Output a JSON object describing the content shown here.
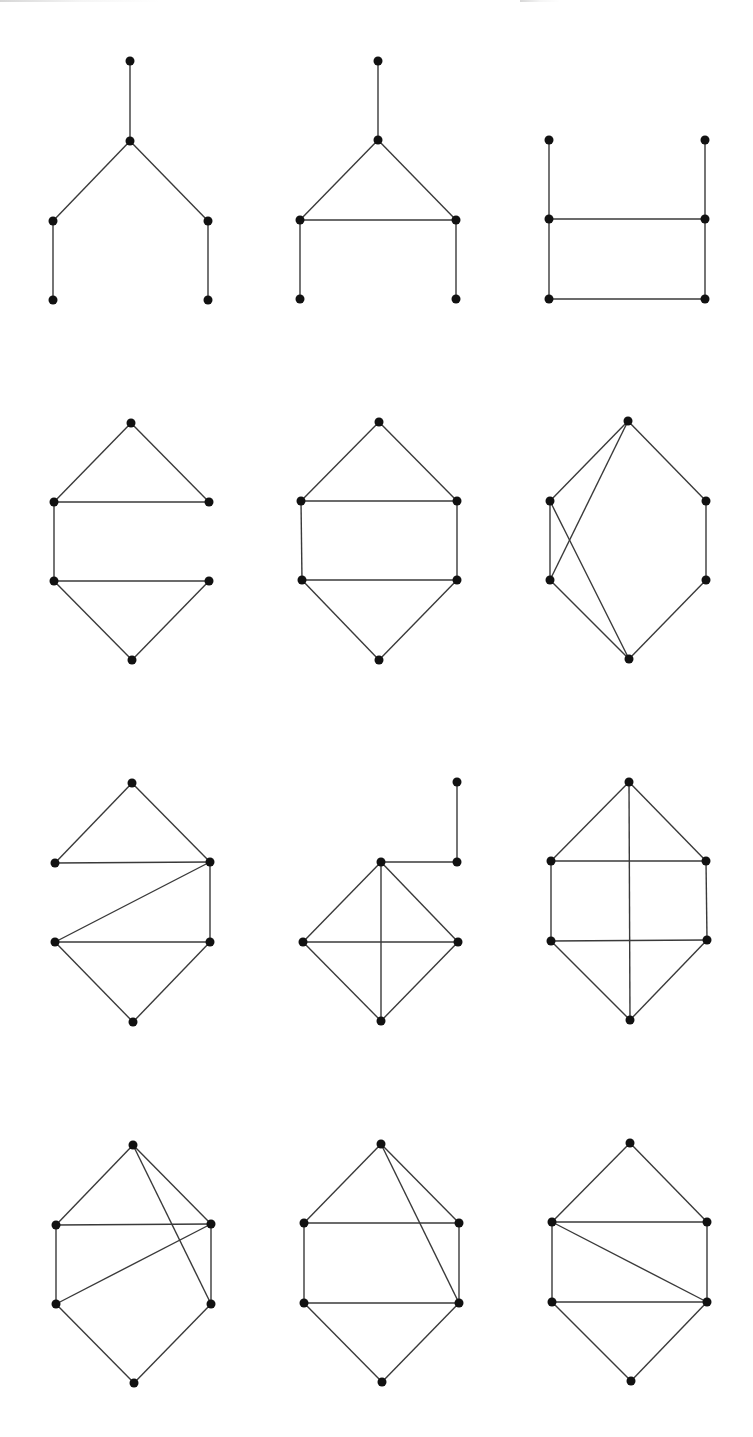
{
  "figure": {
    "width": 753,
    "height": 1437,
    "background": "#ffffff",
    "edge_color": "#3a3a3a",
    "node_color": "#111111",
    "node_radius": 4.5,
    "layout": "3 columns x 4 rows grid of graph drawings"
  },
  "graphs": [
    {
      "id": "graph-1",
      "nodes": [
        [
          130,
          61
        ],
        [
          130,
          141
        ],
        [
          53,
          221
        ],
        [
          208,
          221
        ],
        [
          53,
          300
        ],
        [
          208,
          300
        ]
      ],
      "edges": [
        [
          0,
          1
        ],
        [
          1,
          2
        ],
        [
          1,
          3
        ],
        [
          2,
          4
        ],
        [
          3,
          5
        ]
      ]
    },
    {
      "id": "graph-2",
      "nodes": [
        [
          378,
          61
        ],
        [
          378,
          140
        ],
        [
          300,
          220
        ],
        [
          456,
          220
        ],
        [
          300,
          299
        ],
        [
          456,
          299
        ]
      ],
      "edges": [
        [
          0,
          1
        ],
        [
          1,
          2
        ],
        [
          1,
          3
        ],
        [
          2,
          3
        ],
        [
          2,
          4
        ],
        [
          3,
          5
        ]
      ]
    },
    {
      "id": "graph-3",
      "nodes": [
        [
          549,
          140
        ],
        [
          705,
          140
        ],
        [
          549,
          219
        ],
        [
          705,
          219
        ],
        [
          549,
          299
        ],
        [
          705,
          299
        ]
      ],
      "edges": [
        [
          0,
          2
        ],
        [
          1,
          3
        ],
        [
          2,
          3
        ],
        [
          2,
          4
        ],
        [
          3,
          5
        ],
        [
          4,
          5
        ]
      ]
    },
    {
      "id": "graph-4",
      "nodes": [
        [
          131,
          423
        ],
        [
          54,
          502
        ],
        [
          209,
          502
        ],
        [
          54,
          581
        ],
        [
          209,
          581
        ],
        [
          132,
          660
        ]
      ],
      "edges": [
        [
          0,
          1
        ],
        [
          0,
          2
        ],
        [
          1,
          2
        ],
        [
          1,
          3
        ],
        [
          3,
          4
        ],
        [
          3,
          5
        ],
        [
          4,
          5
        ]
      ]
    },
    {
      "id": "graph-5",
      "nodes": [
        [
          379,
          422
        ],
        [
          301,
          501
        ],
        [
          457,
          501
        ],
        [
          302,
          580
        ],
        [
          457,
          580
        ],
        [
          379,
          660
        ]
      ],
      "edges": [
        [
          0,
          1
        ],
        [
          0,
          2
        ],
        [
          1,
          2
        ],
        [
          1,
          3
        ],
        [
          2,
          4
        ],
        [
          3,
          4
        ],
        [
          3,
          5
        ],
        [
          4,
          5
        ]
      ]
    },
    {
      "id": "graph-6",
      "nodes": [
        [
          628,
          421
        ],
        [
          550,
          501
        ],
        [
          706,
          501
        ],
        [
          550,
          580
        ],
        [
          706,
          580
        ],
        [
          629,
          659
        ]
      ],
      "edges": [
        [
          0,
          1
        ],
        [
          0,
          3
        ],
        [
          0,
          2
        ],
        [
          1,
          3
        ],
        [
          1,
          5
        ],
        [
          3,
          5
        ],
        [
          2,
          4
        ],
        [
          4,
          5
        ]
      ]
    },
    {
      "id": "graph-7",
      "nodes": [
        [
          132,
          783
        ],
        [
          55,
          863
        ],
        [
          210,
          862
        ],
        [
          55,
          942
        ],
        [
          210,
          942
        ],
        [
          133,
          1022
        ]
      ],
      "edges": [
        [
          0,
          1
        ],
        [
          0,
          2
        ],
        [
          1,
          2
        ],
        [
          2,
          3
        ],
        [
          2,
          4
        ],
        [
          3,
          4
        ],
        [
          3,
          5
        ],
        [
          4,
          5
        ]
      ]
    },
    {
      "id": "graph-8",
      "nodes": [
        [
          457,
          782
        ],
        [
          457,
          862
        ],
        [
          381,
          862
        ],
        [
          303,
          942
        ],
        [
          458,
          942
        ],
        [
          381,
          1021
        ]
      ],
      "edges": [
        [
          0,
          1
        ],
        [
          1,
          2
        ],
        [
          2,
          3
        ],
        [
          2,
          4
        ],
        [
          2,
          5
        ],
        [
          3,
          4
        ],
        [
          3,
          5
        ],
        [
          4,
          5
        ]
      ]
    },
    {
      "id": "graph-9",
      "nodes": [
        [
          629,
          782
        ],
        [
          551,
          861
        ],
        [
          706,
          861
        ],
        [
          551,
          941
        ],
        [
          707,
          940
        ],
        [
          630,
          1020
        ]
      ],
      "edges": [
        [
          0,
          1
        ],
        [
          0,
          2
        ],
        [
          0,
          5
        ],
        [
          1,
          2
        ],
        [
          1,
          3
        ],
        [
          2,
          4
        ],
        [
          3,
          4
        ],
        [
          3,
          5
        ],
        [
          4,
          5
        ]
      ]
    },
    {
      "id": "graph-10",
      "nodes": [
        [
          133,
          1145
        ],
        [
          56,
          1225
        ],
        [
          211,
          1224
        ],
        [
          56,
          1304
        ],
        [
          211,
          1304
        ],
        [
          134,
          1383
        ]
      ],
      "edges": [
        [
          0,
          1
        ],
        [
          0,
          2
        ],
        [
          0,
          4
        ],
        [
          1,
          2
        ],
        [
          1,
          3
        ],
        [
          2,
          3
        ],
        [
          2,
          4
        ],
        [
          3,
          5
        ],
        [
          4,
          5
        ]
      ]
    },
    {
      "id": "graph-11",
      "nodes": [
        [
          381,
          1144
        ],
        [
          304,
          1223
        ],
        [
          459,
          1223
        ],
        [
          304,
          1303
        ],
        [
          459,
          1303
        ],
        [
          382,
          1382
        ]
      ],
      "edges": [
        [
          0,
          1
        ],
        [
          0,
          2
        ],
        [
          0,
          4
        ],
        [
          1,
          2
        ],
        [
          1,
          3
        ],
        [
          2,
          4
        ],
        [
          3,
          4
        ],
        [
          3,
          5
        ],
        [
          4,
          5
        ]
      ]
    },
    {
      "id": "graph-12",
      "nodes": [
        [
          630,
          1143
        ],
        [
          552,
          1222
        ],
        [
          707,
          1222
        ],
        [
          552,
          1302
        ],
        [
          707,
          1302
        ],
        [
          631,
          1381
        ]
      ],
      "edges": [
        [
          0,
          1
        ],
        [
          0,
          2
        ],
        [
          1,
          2
        ],
        [
          1,
          3
        ],
        [
          1,
          4
        ],
        [
          2,
          4
        ],
        [
          3,
          4
        ],
        [
          3,
          5
        ],
        [
          4,
          5
        ]
      ]
    }
  ]
}
